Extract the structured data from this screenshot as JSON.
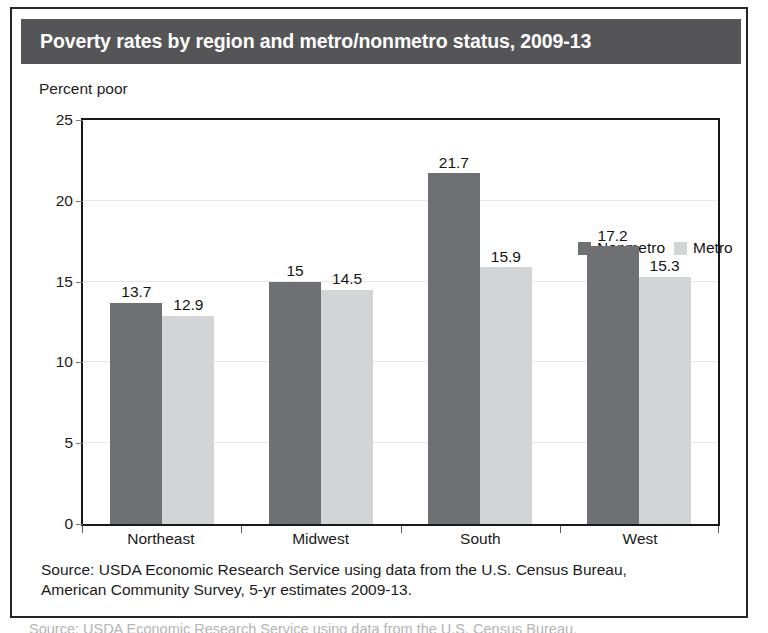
{
  "figure": {
    "title": "Poverty rates by region and metro/nonmetro status, 2009-13",
    "axis_caption": "Percent poor",
    "source_line_1": "Source: USDA Economic Research Service using data from the U.S. Census Bureau,",
    "source_line_2": "American Community Survey, 5-yr estimates 2009-13.",
    "clipped_caption": "Source: USDA Economic Research Service using data from the U.S. Census Bureau,",
    "colors": {
      "title_banner": "#555558",
      "title_text": "#ffffff",
      "nonmetro": "#6e7073",
      "metro": "#d3d4d6",
      "plot_border": "#16181a",
      "gridline": "#e8e8e8",
      "frame_border": "#23272b"
    }
  },
  "chart_data": {
    "type": "bar",
    "title": "Poverty rates by region and metro/nonmetro status, 2009-13",
    "subtitle": "",
    "xlabel": "",
    "ylabel": "Percent poor",
    "ylim": [
      0,
      25
    ],
    "yticks": [
      0,
      5,
      10,
      15,
      20,
      25
    ],
    "ytick_labels": [
      "0",
      "5",
      "10",
      "15",
      "20",
      "25"
    ],
    "grid": true,
    "grid_axis": "y",
    "legend_position": "inside top-right",
    "categories": [
      "Northeast",
      "Midwest",
      "South",
      "West"
    ],
    "series": [
      {
        "name": "Nonmetro",
        "color": "#6e7073",
        "values": [
          13.7,
          15,
          21.7,
          17.2
        ],
        "labels": [
          "13.7",
          "15",
          "21.7",
          "17.2"
        ]
      },
      {
        "name": "Metro",
        "color": "#d3d4d6",
        "values": [
          12.9,
          14.5,
          15.9,
          15.3
        ],
        "labels": [
          "12.9",
          "14.5",
          "15.9",
          "15.3"
        ]
      }
    ]
  }
}
